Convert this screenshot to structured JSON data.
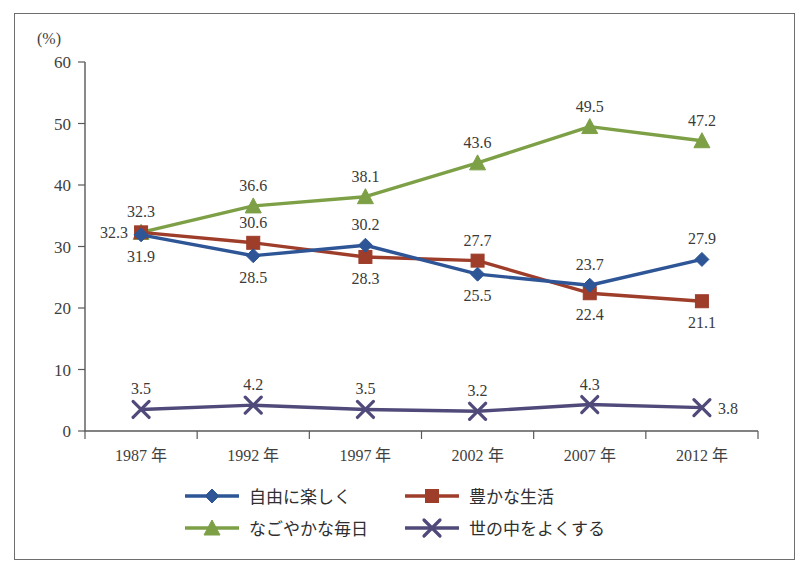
{
  "chart_data": {
    "type": "line",
    "title": "",
    "subtitle": "",
    "xlabel": "",
    "ylabel": "",
    "unit_label": "(%)",
    "grid": false,
    "legend_position": "bottom",
    "categories": [
      "1987 年",
      "1992 年",
      "1997 年",
      "2002 年",
      "2007 年",
      "2012 年"
    ],
    "ylim": [
      0,
      60
    ],
    "ytick_values": [
      0,
      10,
      20,
      30,
      40,
      50,
      60
    ],
    "ytick_labels": [
      "0",
      "10",
      "20",
      "30",
      "40",
      "50",
      "60"
    ],
    "series": [
      {
        "name": "自由に楽しく",
        "color": "#2E5596",
        "marker": "diamond",
        "values": [
          31.9,
          28.5,
          30.2,
          25.5,
          23.7,
          27.9
        ],
        "labels": [
          "31.9",
          "28.5",
          "30.2",
          "25.5",
          "23.7",
          "27.9"
        ],
        "label_positions": [
          "below",
          "below",
          "above",
          "below",
          "above",
          "above"
        ]
      },
      {
        "name": "豊かな生活",
        "color": "#9E3D2A",
        "marker": "square",
        "values": [
          32.3,
          30.6,
          28.3,
          27.7,
          22.4,
          21.1
        ],
        "labels": [
          "32.3",
          "30.6",
          "28.3",
          "27.7",
          "22.4",
          "21.1"
        ],
        "label_positions": [
          "left",
          "above",
          "below",
          "above",
          "below",
          "below"
        ]
      },
      {
        "name": "なごやかな毎日",
        "color": "#7DA046",
        "marker": "triangle",
        "values": [
          32.3,
          36.6,
          38.1,
          43.6,
          49.5,
          47.2
        ],
        "labels": [
          "32.3",
          "36.6",
          "38.1",
          "43.6",
          "49.5",
          "47.2"
        ],
        "label_positions": [
          "above",
          "above",
          "above",
          "above",
          "above",
          "above"
        ]
      },
      {
        "name": "世の中をよくする",
        "color": "#4F4A7A",
        "marker": "x",
        "values": [
          3.5,
          4.2,
          3.5,
          3.2,
          4.3,
          3.8
        ],
        "labels": [
          "3.5",
          "4.2",
          "3.5",
          "3.2",
          "4.3",
          "3.8"
        ],
        "label_positions": [
          "above",
          "above",
          "above",
          "above",
          "above",
          "right"
        ]
      }
    ]
  },
  "legend": {
    "items": [
      {
        "label": "自由に楽しく",
        "color": "#2E5596",
        "marker": "diamond"
      },
      {
        "label": "豊かな生活",
        "color": "#9E3D2A",
        "marker": "square"
      },
      {
        "label": "なごやかな毎日",
        "color": "#7DA046",
        "marker": "triangle"
      },
      {
        "label": "世の中をよくする",
        "color": "#4F4A7A",
        "marker": "x"
      }
    ]
  }
}
